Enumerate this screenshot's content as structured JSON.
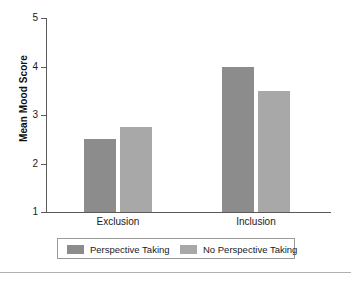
{
  "chart_data": {
    "type": "bar",
    "title": "",
    "xlabel": "",
    "ylabel": "Mean Mood Score",
    "categories": [
      "Exclusion",
      "Inclusion"
    ],
    "series": [
      {
        "name": "Perspective Taking",
        "values": [
          2.5,
          4.0
        ],
        "color": "#8c8c8c"
      },
      {
        "name": "No Perspective Taking",
        "values": [
          2.75,
          3.5
        ],
        "color": "#a8a8a8"
      }
    ],
    "ylim": [
      1,
      5
    ],
    "yticks": [
      1,
      2,
      3,
      4,
      5
    ],
    "ytick_labels": [
      "1",
      "2",
      "3",
      "4",
      "5"
    ],
    "grid": false,
    "legend_position": "bottom"
  },
  "axis": {
    "y_title": "Mean Mood Score",
    "y_ticks": [
      "5",
      "4",
      "3",
      "2",
      "1"
    ],
    "x_labels": [
      "Exclusion",
      "Inclusion"
    ]
  },
  "legend": {
    "entries": [
      {
        "label": "Perspective Taking"
      },
      {
        "label": "No Perspective Taking"
      }
    ]
  },
  "colors": {
    "series_dark": "#8c8c8c",
    "series_light": "#a8a8a8",
    "axis": "#5a5a5a",
    "legend_border": "#9a9a9a",
    "rule": "#b0b0b0"
  }
}
